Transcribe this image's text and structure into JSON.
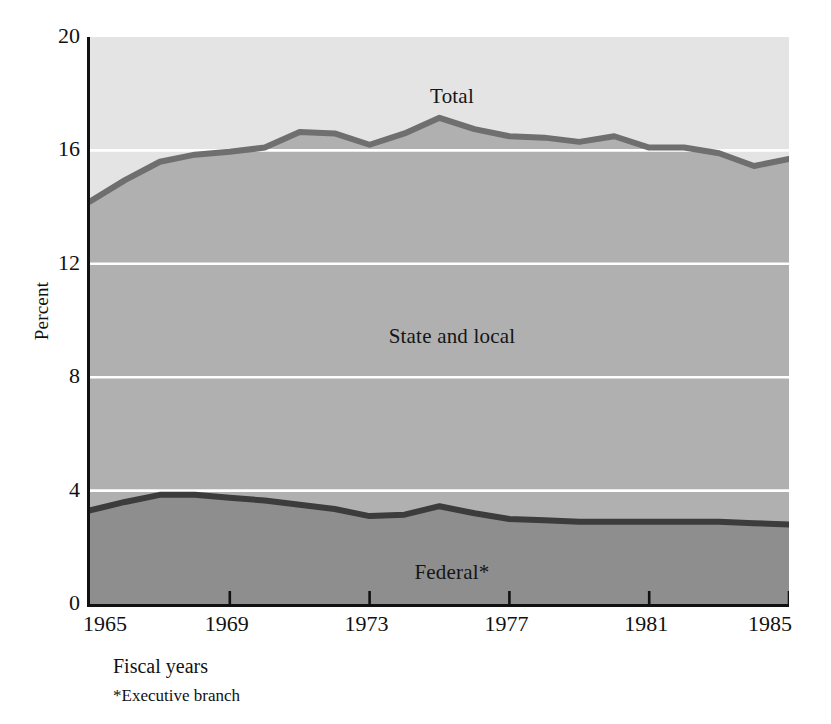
{
  "chart_data": {
    "type": "area",
    "title": "",
    "subtitle": "",
    "xlabel": "Fiscal years",
    "ylabel": "Percent",
    "footnote": "*Executive branch",
    "grid": true,
    "grid_color": "#ffffff",
    "legend_position": "inline-labels",
    "stacked": true,
    "xlim": [
      1965,
      1985
    ],
    "ylim": [
      0,
      20
    ],
    "yticks": [
      0,
      4,
      8,
      12,
      16,
      20
    ],
    "ytick_labels": [
      "0",
      "4",
      "8",
      "12",
      "16",
      "20"
    ],
    "xticks": [
      1965,
      1969,
      1973,
      1977,
      1981,
      1985
    ],
    "xtick_labels": [
      "1965",
      "1969",
      "1973",
      "1977",
      "1981",
      "1985"
    ],
    "x": [
      1965,
      1966,
      1967,
      1968,
      1969,
      1970,
      1971,
      1972,
      1973,
      1974,
      1975,
      1976,
      1977,
      1978,
      1979,
      1980,
      1981,
      1982,
      1983,
      1984,
      1985
    ],
    "series": [
      {
        "name": "Federal*",
        "label": "Federal*",
        "fill_color": "#8e8e8e",
        "line_color": "#3c3c3c",
        "values": [
          3.3,
          3.6,
          3.85,
          3.85,
          3.75,
          3.65,
          3.5,
          3.35,
          3.1,
          3.15,
          3.45,
          3.2,
          3.0,
          2.95,
          2.9,
          2.9,
          2.9,
          2.9,
          2.9,
          2.85,
          2.8
        ]
      },
      {
        "name": "State and local",
        "label": "State and local",
        "fill_color": "#b0b0b0",
        "line_color": "#b0b0b0",
        "values": [
          10.9,
          11.35,
          11.75,
          12.0,
          12.2,
          12.45,
          13.15,
          13.25,
          13.1,
          13.45,
          13.7,
          13.55,
          13.5,
          13.5,
          13.4,
          13.6,
          13.2,
          13.2,
          13.0,
          12.6,
          12.9
        ]
      }
    ],
    "total": {
      "name": "Total",
      "label": "Total",
      "line_color": "#6f6f6f",
      "values": [
        14.2,
        14.95,
        15.6,
        15.85,
        15.95,
        16.1,
        16.65,
        16.6,
        16.2,
        16.6,
        17.15,
        16.75,
        16.5,
        16.45,
        16.3,
        16.5,
        16.1,
        16.1,
        15.9,
        15.45,
        15.7
      ]
    },
    "inline_labels": [
      {
        "text": "Total",
        "x_px": 449,
        "y_px": 84
      },
      {
        "text": "State and local",
        "x_px": 449,
        "y_px": 324
      },
      {
        "text": "Federal*",
        "x_px": 449,
        "y_px": 560
      }
    ],
    "background_color": "#ffffff",
    "plot_top_band_color": "#e4e4e4"
  }
}
